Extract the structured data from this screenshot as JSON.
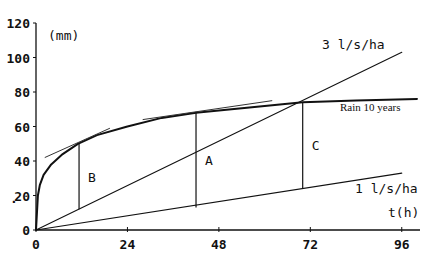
{
  "chart_data": {
    "type": "line",
    "title": "",
    "xlabel": "t(h)",
    "ylabel": "(mm)",
    "xlim": [
      0,
      100
    ],
    "ylim": [
      0,
      120
    ],
    "x_ticks": [
      0,
      24,
      48,
      72,
      96
    ],
    "y_ticks": [
      0,
      20,
      40,
      60,
      80,
      100,
      120
    ],
    "grid": false,
    "legend": "inline labels",
    "series": [
      {
        "name": "Rain 10 years",
        "x": [
          0,
          0.5,
          1,
          2,
          4,
          7,
          11,
          16,
          24,
          33,
          42,
          56,
          70,
          84,
          100
        ],
        "values": [
          0,
          20,
          26,
          32,
          38,
          44,
          50,
          55,
          60,
          65,
          68,
          71,
          74,
          75,
          76
        ]
      },
      {
        "name": "3 l/s/ha",
        "x": [
          0,
          96
        ],
        "values": [
          0,
          103
        ]
      },
      {
        "name": "1 l/s/ha",
        "x": [
          0,
          96
        ],
        "values": [
          0,
          33
        ]
      }
    ],
    "tangents": [
      {
        "near": "B",
        "x": [
          2.3,
          19.4
        ],
        "values": [
          42,
          59
        ]
      },
      {
        "near": "A",
        "x": [
          28,
          62
        ],
        "values": [
          64,
          75
        ]
      }
    ],
    "annotations": [
      {
        "label": "B",
        "t": 11.3,
        "from_mm": 12,
        "to_mm": 50
      },
      {
        "label": "A",
        "t": 42,
        "from_mm": 13,
        "to_mm": 68
      },
      {
        "label": "C",
        "t": 70,
        "from_mm": 24,
        "to_mm": 74
      }
    ]
  },
  "labels": {
    "y_unit": "(mm)",
    "x_unit": "t(h)",
    "rain": "Rain 10 years",
    "line3": "3 l/s/ha",
    "line1": "1 l/s/ha",
    "stray_mark": "."
  }
}
